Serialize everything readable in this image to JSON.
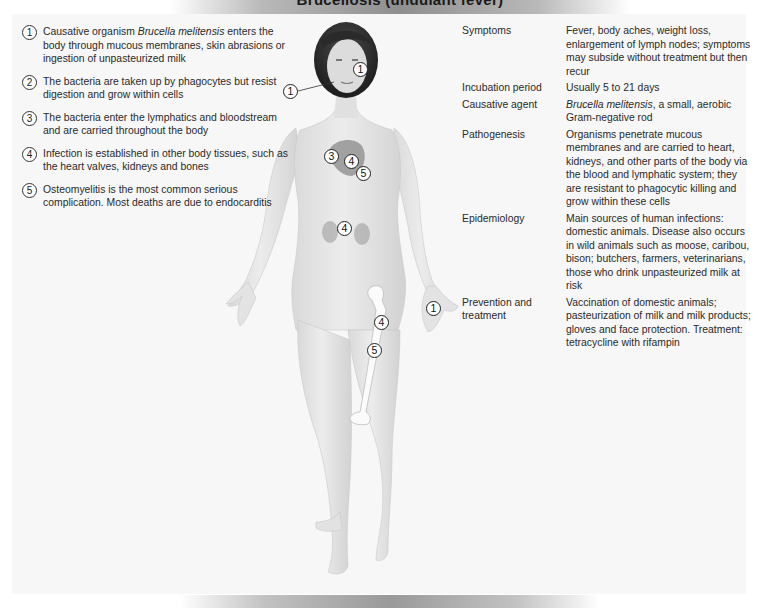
{
  "title_strip": {
    "text": "Brucellosis (undulant fever)"
  },
  "steps": [
    {
      "num": "1",
      "text_pre": "Causative organism ",
      "text_italic": "Brucella melitensis",
      "text_post": " enters the body through mucous membranes, skin abrasions or ingestion of unpasteurized milk"
    },
    {
      "num": "2",
      "text": "The bacteria are taken up by phagocytes but resist digestion and grow within cells"
    },
    {
      "num": "3",
      "text": "The bacteria enter the lymphatics and bloodstream and are carried throughout the body"
    },
    {
      "num": "4",
      "text": "Infection is established in other body tissues, such as the heart valves, kidneys and bones"
    },
    {
      "num": "5",
      "text": "Osteomyelitis is the most common serious complication. Most deaths are due to endocarditis"
    }
  ],
  "info": {
    "symptoms": {
      "label": "Symptoms",
      "value": "Fever, body aches, weight loss, enlargement of lymph nodes; symptoms may subside without treatment but then recur"
    },
    "incubation": {
      "label": "Incubation period",
      "value": "Usually 5 to 21 days"
    },
    "agent": {
      "label": "Causative agent",
      "value_italic": "Brucella melitensis",
      "value_rest": ", a small, aerobic Gram-negative rod"
    },
    "pathogenesis": {
      "label": "Pathogenesis",
      "value": "Organisms penetrate mucous membranes and are carried to heart, kidneys, and other parts of the body via the blood and lymphatic system; they are resistant to phagocytic killing and grow within these cells"
    },
    "epidemiology": {
      "label": "Epidemiology",
      "value": "Main sources of human infections: domestic animals. Disease also occurs in wild animals such as moose, caribou, bison; butchers, farmers, veterinarians, those who drink unpasteurized milk at risk"
    },
    "prevention": {
      "label": "Prevention and treatment",
      "value": "Vaccination of domestic animals; pasteurization of milk and milk products; gloves and face protection. Treatment: tetracycline with rifampin"
    }
  },
  "markers": {
    "face_right": "1",
    "face_left": "1",
    "heart_3": "3",
    "heart_4": "4",
    "heart_5": "5",
    "kidney_4": "4",
    "femur_4": "4",
    "femur_5": "5",
    "hand_1": "1"
  },
  "colors": {
    "panel_bg": "#f7f7f7",
    "skin": "#e4e4e4",
    "hair": "#2b2b2b",
    "organ": "#9a9a9a"
  }
}
